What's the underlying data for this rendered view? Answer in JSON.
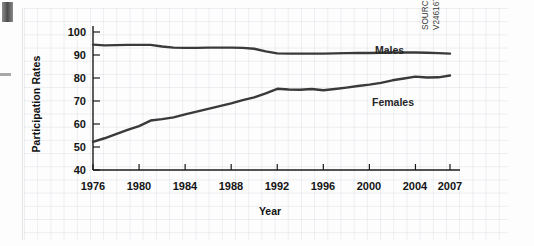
{
  "chart_data": {
    "type": "line",
    "title": "",
    "xlabel": "Year",
    "ylabel": "Participation Rates",
    "xlim": [
      1976,
      2007
    ],
    "ylim": [
      40,
      100
    ],
    "yticks": [
      40,
      50,
      60,
      70,
      80,
      90,
      100
    ],
    "xticks": [
      1976,
      1980,
      1984,
      1988,
      1992,
      1996,
      2000,
      2004,
      2007
    ],
    "grid": true,
    "legend_position": "inline-right",
    "x": [
      1976,
      1977,
      1978,
      1979,
      1980,
      1981,
      1982,
      1983,
      1984,
      1985,
      1986,
      1987,
      1988,
      1989,
      1990,
      1991,
      1992,
      1993,
      1994,
      1995,
      1996,
      1997,
      1998,
      1999,
      2000,
      2001,
      2002,
      2003,
      2004,
      2005,
      2006,
      2007
    ],
    "series": [
      {
        "name": "Males",
        "color": "#3a3a3a",
        "values": [
          94.5,
          94.2,
          94.3,
          94.4,
          94.4,
          94.4,
          93.7,
          93.2,
          93.1,
          93.1,
          93.2,
          93.2,
          93.2,
          93.1,
          92.7,
          91.6,
          90.7,
          90.6,
          90.6,
          90.6,
          90.6,
          90.7,
          90.8,
          90.9,
          90.9,
          91.0,
          91.1,
          91.1,
          91.1,
          91.0,
          90.8,
          90.6
        ]
      },
      {
        "name": "Females",
        "color": "#3a3a3a",
        "values": [
          52.2,
          53.8,
          55.6,
          57.4,
          59.1,
          61.5,
          62.1,
          62.9,
          64.2,
          65.4,
          66.6,
          67.8,
          69.0,
          70.4,
          71.6,
          73.3,
          75.3,
          75.0,
          74.9,
          75.2,
          74.7,
          75.2,
          75.8,
          76.5,
          77.1,
          77.9,
          79.0,
          79.8,
          80.6,
          80.2,
          80.3,
          81.1
        ]
      }
    ],
    "annotations": [
      {
        "text": "Males",
        "x": 2001,
        "y": 95.5
      },
      {
        "text": "Females",
        "x": 2000,
        "y": 72.0
      }
    ],
    "source": {
      "line1": "SOURCE: Statistics Canada, CANSIM Series",
      "line2": "V2461670 and V2461460."
    }
  },
  "axis": {
    "y_labels": [
      "100",
      "90",
      "80",
      "70",
      "60",
      "50",
      "40"
    ],
    "x_labels": [
      "1976",
      "1980",
      "1984",
      "1988",
      "1992",
      "1996",
      "2000",
      "2004",
      "2007"
    ],
    "y_title": "Participation Rates",
    "x_title": "Year"
  },
  "legend": {
    "males": "Males",
    "females": "Females"
  },
  "source": {
    "line1": "SOURCE: Statistics Canada, CANSIM Series",
    "line2": "V2461670 and V2461460."
  }
}
